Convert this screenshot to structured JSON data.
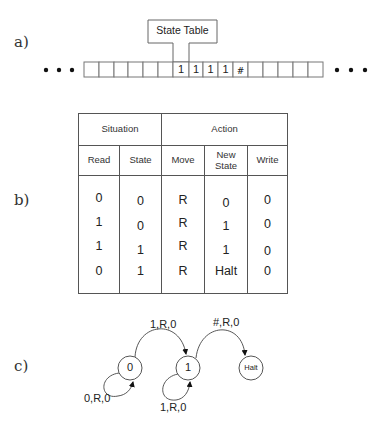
{
  "labels": {
    "a": "a)",
    "b": "b)",
    "c": "c)"
  },
  "tape": {
    "head_label": "State Table",
    "ellipsis": "• • •",
    "cells": [
      "",
      "",
      "",
      "",
      "",
      "",
      "1",
      "1",
      "1",
      "1",
      "#",
      "",
      "",
      "",
      "",
      ""
    ]
  },
  "table": {
    "group_headers": [
      "Situation",
      "Action"
    ],
    "columns": [
      "Read",
      "State",
      "Move",
      "New\nState",
      "Write"
    ],
    "columns_display": {
      "read": "Read",
      "state": "State",
      "move": "Move",
      "new_state_1": "New",
      "new_state_2": "State",
      "write": "Write"
    },
    "rows": [
      [
        "0",
        "0",
        "R",
        "0",
        "0"
      ],
      [
        "1",
        "0",
        "R",
        "1",
        "0"
      ],
      [
        "1",
        "1",
        "R",
        "1",
        "0"
      ],
      [
        "0",
        "1",
        "R",
        "Halt",
        "0"
      ]
    ]
  },
  "state_diagram": {
    "states": [
      {
        "id": "0",
        "label": "0"
      },
      {
        "id": "1",
        "label": "1"
      },
      {
        "id": "halt",
        "label": "Halt"
      }
    ],
    "transitions": [
      {
        "from": "0",
        "to": "0",
        "label": "0,R,0"
      },
      {
        "from": "0",
        "to": "1",
        "label": "1,R,0"
      },
      {
        "from": "1",
        "to": "1",
        "label": "1,R,0"
      },
      {
        "from": "1",
        "to": "halt",
        "label": "#,R,0"
      }
    ]
  }
}
